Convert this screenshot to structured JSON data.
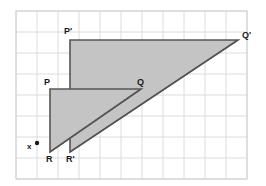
{
  "figure": {
    "background_color": "#ffffff"
  },
  "grid": {
    "label": "coordinate grid",
    "origin_x": 16,
    "origin_y": 11,
    "cell_size": 21,
    "cols": 11,
    "rows": 8,
    "line_color": "#dcdcdc",
    "border_color": "#d0d0d0",
    "show": true
  },
  "center_of_dilation": {
    "label": "x",
    "label_x": 27,
    "label_y": 149,
    "point_x": 37,
    "point_y": 143,
    "dot_radius": 2.2,
    "color": "#1a1a1a"
  },
  "shapes": {
    "fill_color": "#c4c4c4",
    "stroke_color": "#555555",
    "stroke_width": 1.6,
    "preimage": {
      "name": "triangle-PQR",
      "points": "50,89 141,89 50,152",
      "vertices": [
        {
          "label": "P",
          "x": 50,
          "y": 89,
          "label_x": 44,
          "label_y": 85
        },
        {
          "label": "Q",
          "x": 141,
          "y": 89,
          "label_x": 137,
          "label_y": 85
        },
        {
          "label": "R",
          "x": 50,
          "y": 152,
          "label_x": 46,
          "label_y": 162
        }
      ]
    },
    "image": {
      "name": "triangle-P-prime-Q-prime-R-prime",
      "points": "70,40 238,40 70,152",
      "vertices": [
        {
          "label": "P'",
          "x": 70,
          "y": 40,
          "label_x": 64,
          "label_y": 34
        },
        {
          "label": "Q'",
          "x": 238,
          "y": 40,
          "label_x": 242,
          "label_y": 38
        },
        {
          "label": "R'",
          "x": 70,
          "y": 152,
          "label_x": 66,
          "label_y": 162
        }
      ]
    }
  },
  "rays": {
    "stroke_color": "#555555",
    "stroke_width": 1.4,
    "segments": [
      {
        "name": "ray-to-Q",
        "x1": 50,
        "y1": 152,
        "x2": 141,
        "y2": 89
      },
      {
        "name": "ray-to-Q-prime",
        "x1": 70,
        "y1": 152,
        "x2": 238,
        "y2": 40
      }
    ]
  }
}
